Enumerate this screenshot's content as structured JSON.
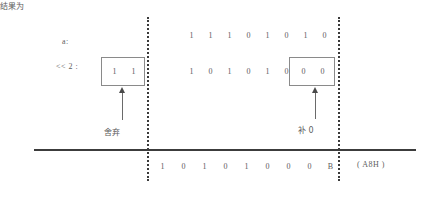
{
  "diagram": {
    "labels": {
      "operand": "a:",
      "operation": "<< 2 :",
      "result": "结果为",
      "hex_value": "( A8H )"
    },
    "annotations": {
      "discard": "舍弃",
      "pad_zero": "补 0"
    },
    "rows": {
      "original": [
        "1",
        "1",
        "1",
        "0",
        "1",
        "0",
        "1",
        "0"
      ],
      "shifted": [
        "1",
        "0",
        "1",
        "0",
        "1",
        "0"
      ],
      "result": [
        "1",
        "0",
        "1",
        "0",
        "1",
        "0",
        "0",
        "0",
        "B"
      ]
    },
    "boxes": {
      "discarded_bits": [
        "1",
        "1"
      ],
      "padded_bits": [
        "0",
        "0"
      ]
    },
    "colors": {
      "text": "#5d5d5d",
      "rule": "#3c3c3c",
      "box_border": "#8a8a8a",
      "dotted": "#3a3a3a"
    }
  }
}
